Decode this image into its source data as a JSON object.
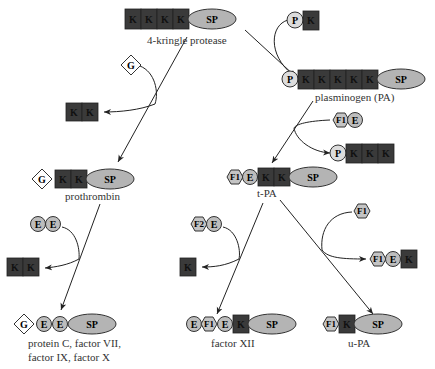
{
  "diagram": {
    "labels": {
      "kringle4": "4-kringle protease",
      "plasminogen": "plasminogen (PA)",
      "prothrombin": "prothrombin",
      "tpa": "t-PA",
      "proteinc_1": "protein C, factor VII,",
      "proteinc_2": "factor IX, factor X",
      "factor12": "factor XII",
      "upa": "u-PA"
    },
    "domain_letters": {
      "kringle": "K",
      "serine_protease": "SP",
      "pan": "P",
      "gla": "G",
      "egf": "E",
      "fibronectin1": "F1",
      "fibronectin2": "F2"
    },
    "nodes": [
      {
        "id": "4-kringle-protease",
        "domains": [
          "K",
          "K",
          "K",
          "K",
          "SP"
        ]
      },
      {
        "id": "plasminogen",
        "domains": [
          "P",
          "K",
          "K",
          "K",
          "K",
          "K",
          "SP"
        ]
      },
      {
        "id": "prothrombin",
        "domains": [
          "G",
          "K",
          "K",
          "SP"
        ]
      },
      {
        "id": "t-PA",
        "domains": [
          "F1",
          "E",
          "K",
          "K",
          "SP"
        ]
      },
      {
        "id": "protein-c-factors",
        "domains": [
          "G",
          "E",
          "E",
          "SP"
        ]
      },
      {
        "id": "factor-XII",
        "domains": [
          "E",
          "F1",
          "E",
          "K",
          "SP"
        ]
      },
      {
        "id": "u-PA",
        "domains": [
          "F1",
          "K",
          "SP"
        ]
      }
    ],
    "modules": [
      {
        "id": "insert-PK",
        "domains": [
          "P",
          "K"
        ]
      },
      {
        "id": "insert-G",
        "domains": [
          "G"
        ]
      },
      {
        "id": "lost-KK",
        "domains": [
          "K",
          "K"
        ]
      },
      {
        "id": "insert-F1E",
        "domains": [
          "F1",
          "E"
        ]
      },
      {
        "id": "lost-PKKK",
        "domains": [
          "P",
          "K",
          "K",
          "K"
        ]
      },
      {
        "id": "insert-EE",
        "domains": [
          "E",
          "E"
        ]
      },
      {
        "id": "lost-KK-2",
        "domains": [
          "K",
          "K"
        ]
      },
      {
        "id": "insert-F2E",
        "domains": [
          "F2",
          "E"
        ]
      },
      {
        "id": "lost-K",
        "domains": [
          "K"
        ]
      },
      {
        "id": "insert-F1",
        "domains": [
          "F1"
        ]
      },
      {
        "id": "lost-F1EK",
        "domains": [
          "F1",
          "E",
          "K"
        ]
      }
    ]
  }
}
